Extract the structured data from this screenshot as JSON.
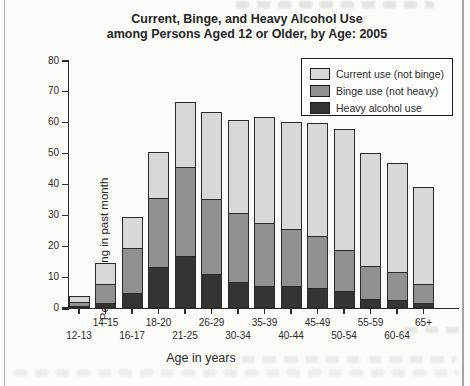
{
  "title": {
    "line1": "Current, Binge, and Heavy Alcohol Use",
    "line2": "among Persons Aged 12 or Older, by Age: 2005"
  },
  "chart_data": {
    "type": "bar",
    "stacked": true,
    "title": "Current, Binge, and Heavy Alcohol Use among Persons Aged 12 or Older, by Age: 2005",
    "xlabel": "Age in years",
    "ylabel": "Percent using in past month",
    "ylim": [
      0,
      80
    ],
    "yticks": [
      0,
      10,
      20,
      30,
      40,
      50,
      60,
      70,
      80
    ],
    "grid": false,
    "legend_position": "top-right",
    "categories": [
      "12-13",
      "14-15",
      "16-17",
      "18-20",
      "21-25",
      "26-29",
      "30-34",
      "35-39",
      "40-44",
      "45-49",
      "50-54",
      "55-59",
      "60-64",
      "65+"
    ],
    "series": [
      {
        "name": "Heavy alcohol use",
        "color": "#343430",
        "values": [
          0.3,
          1.7,
          5.0,
          13.3,
          17.0,
          11.0,
          8.5,
          7.0,
          7.0,
          6.5,
          5.5,
          3.0,
          2.5,
          1.5
        ]
      },
      {
        "name": "Binge use (not heavy)",
        "color": "#90908c",
        "values": [
          1.6,
          6.3,
          14.7,
          22.8,
          29.1,
          24.5,
          22.5,
          21.0,
          19.0,
          17.0,
          13.5,
          11.0,
          9.5,
          6.5
        ]
      },
      {
        "name": "Current use (not binge)",
        "color": "#d8d8d5",
        "values": [
          2.3,
          7.1,
          10.4,
          15.0,
          21.3,
          28.5,
          30.5,
          34.5,
          35.0,
          37.0,
          39.5,
          37.0,
          35.5,
          32.0
        ]
      }
    ],
    "totals": {
      "current_use_total": [
        4.2,
        15.1,
        30.1,
        51.1,
        67.4,
        64.0,
        61.5,
        62.5,
        61.0,
        60.5,
        58.5,
        51.0,
        47.5,
        40.0
      ],
      "binge_use_total": [
        1.9,
        8.0,
        19.7,
        36.1,
        46.1,
        35.5,
        31.0,
        28.0,
        26.0,
        23.5,
        19.0,
        14.0,
        12.0,
        8.0
      ],
      "heavy_use_total": [
        0.3,
        1.7,
        5.0,
        13.3,
        17.0,
        11.0,
        8.5,
        7.0,
        7.0,
        6.5,
        5.5,
        3.0,
        2.5,
        1.5
      ]
    },
    "legend_items": [
      "Current use (not binge)",
      "Binge use (not heavy)",
      "Heavy alcohol use"
    ]
  },
  "colors": {
    "current_not_binge": "#d8d8d5",
    "binge_not_heavy": "#90908c",
    "heavy": "#343430",
    "axis": "#2b2b2b",
    "page_background": "#fbfbf8"
  }
}
